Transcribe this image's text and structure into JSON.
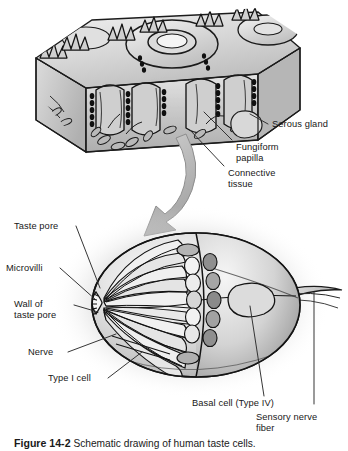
{
  "figure": {
    "domain": "anatomical-illustration",
    "style": "grayscale textbook line-and-wash drawing",
    "width": 348,
    "height": 451,
    "background_color": "#ffffff",
    "ink_color": "#141414",
    "wash_colors": [
      "#ffffff",
      "#e8e8e8",
      "#cfcfcf",
      "#b4b4b4",
      "#969696",
      "#6e6e6e",
      "#3c3c3c"
    ]
  },
  "panels": {
    "top": {
      "name": "tongue-epithelium-block",
      "description": "Three-dimensional cut block of tongue surface showing a fungiform papilla with central pore, surrounding trench, epithelium and underlying connective tissue."
    },
    "arrow": {
      "name": "magnification-arrow",
      "description": "Large curved gray arrow sweeping from the tissue block down and to the left toward the magnified taste bud.",
      "color": "#b9b9b9"
    },
    "bottom": {
      "name": "taste-bud-magnified",
      "description": "Ovoid taste bud in cutaway, elongated taste cells radiating toward the taste pore at left, basal cells at the base, sensory nerve fiber exiting to the right, set on a soft radial gray vignette."
    }
  },
  "labels": {
    "left": [
      {
        "id": "taste-pore",
        "text": "Taste pore"
      },
      {
        "id": "microvilli",
        "text": "Microvilli"
      },
      {
        "id": "wall-of-taste-pore",
        "text": "Wall of\ntaste pore"
      },
      {
        "id": "nerve",
        "text": "Nerve"
      },
      {
        "id": "type-i-cell",
        "text": "Type I cell"
      }
    ],
    "upper_right": [
      {
        "id": "serous-gland",
        "text": "Serous gland"
      },
      {
        "id": "fungiform-papilla",
        "text": "Fungiform\npapilla"
      },
      {
        "id": "connective-tissue",
        "text": "Connective\ntissue"
      }
    ],
    "lower_right": [
      {
        "id": "basal-cell",
        "text": "Basal cell (Type IV)"
      },
      {
        "id": "sensory-nerve-fiber",
        "text": "Sensory nerve\nfiber"
      }
    ]
  },
  "caption": {
    "number": "Figure 14-2",
    "text": "Schematic drawing of human taste cells."
  }
}
